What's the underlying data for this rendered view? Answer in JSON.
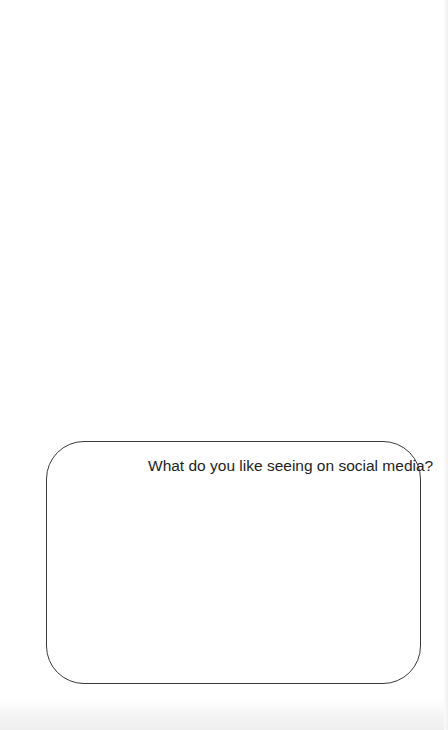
{
  "worksheet": {
    "question_box": {
      "prompt": "What do you like seeing on social media?",
      "answer": ""
    }
  }
}
